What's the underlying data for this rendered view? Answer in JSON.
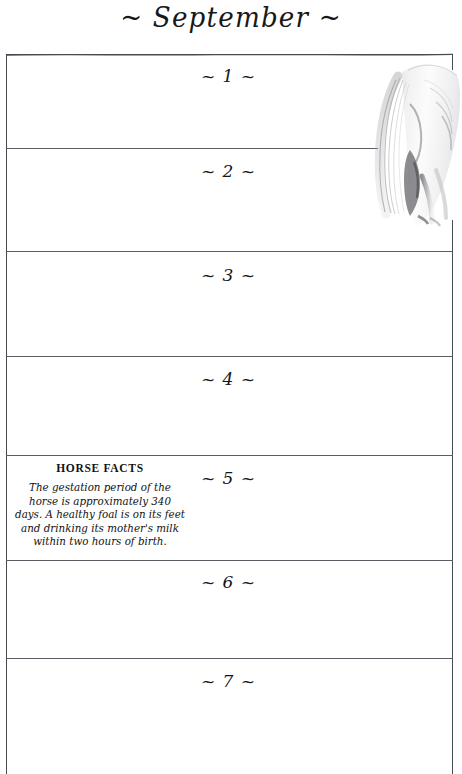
{
  "page": {
    "month_title": "~ September ~",
    "background_color": "#ffffff",
    "ink_color": "#1a1a1a",
    "rule_color": "#5b5b63",
    "frame_color": "#4a4a52"
  },
  "calendar": {
    "days": [
      {
        "label": "~ 1 ~",
        "number": 1
      },
      {
        "label": "~ 2 ~",
        "number": 2
      },
      {
        "label": "~ 3 ~",
        "number": 3
      },
      {
        "label": "~ 4 ~",
        "number": 4
      },
      {
        "label": "~ 5 ~",
        "number": 5
      },
      {
        "label": "~ 6 ~",
        "number": 6
      },
      {
        "label": "~ 7 ~",
        "number": 7
      }
    ]
  },
  "horse_facts": {
    "heading": "HORSE FACTS",
    "body": "The gestation period of the horse is approximately 340 days. A healthy foal is on its feet and drinking its mother's milk within two hours of birth."
  },
  "illustration": {
    "name": "horse-pencil-sketch",
    "description": "faint graphite sketch of a horse's hindquarters and tail"
  }
}
